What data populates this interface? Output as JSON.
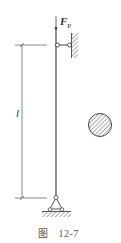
{
  "figure": {
    "caption_prefix": "图",
    "caption_number": "12-7",
    "load_label": "F",
    "load_subscript": "P",
    "length_label": "l",
    "stroke_color": "#444444",
    "hatch_color": "#555555"
  },
  "components": {
    "column": "slender-column",
    "top_support": "lateral-link-to-wall",
    "bottom_support": "pin-support",
    "cross_section": "solid-circular-section"
  }
}
